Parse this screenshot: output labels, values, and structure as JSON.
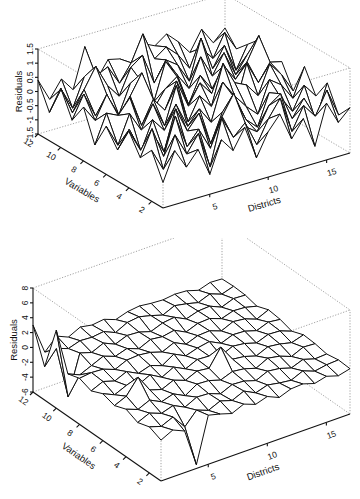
{
  "chart_data": [
    {
      "type": "surface",
      "title": "",
      "xlabel": "Districts",
      "ylabel": "Variables",
      "zlabel": "Residuals",
      "x_ticks": [
        5,
        10,
        15
      ],
      "y_ticks": [
        2,
        4,
        6,
        8,
        10,
        12
      ],
      "z_ticks": [
        -1.5,
        -1,
        -0.5,
        0,
        0.5,
        1,
        1.5
      ],
      "z_tick_labels": [
        "-1.5",
        "-1",
        "-0.5",
        "0",
        "0.5",
        "1",
        "1.5"
      ],
      "xlim": [
        1,
        17
      ],
      "ylim": [
        1,
        12
      ],
      "zlim": [
        -1.5,
        1.5
      ],
      "grid": "wireframe",
      "n_districts": 17,
      "n_variables": 12,
      "z": [
        [
          -0.6,
          0.4,
          -0.3,
          0.2,
          -0.8,
          0.3,
          -0.2,
          0.5,
          -0.7,
          0.1,
          0.6,
          -0.4,
          0.2,
          -0.9,
          0.5,
          -0.3,
          0.1
        ],
        [
          0.3,
          -0.5,
          0.6,
          -0.2,
          0.4,
          -0.9,
          0.7,
          -0.1,
          0.3,
          -0.6,
          0.2,
          0.8,
          -0.5,
          0.3,
          -0.2,
          0.6,
          -0.4
        ],
        [
          -0.2,
          0.7,
          -0.4,
          0.9,
          -0.3,
          0.2,
          -0.6,
          0.4,
          1.1,
          -0.2,
          -0.5,
          0.3,
          0.6,
          -0.4,
          0.2,
          -0.7,
          0.5
        ],
        [
          0.5,
          -0.3,
          0.2,
          -0.6,
          0.8,
          -0.1,
          0.4,
          -0.8,
          0.2,
          0.6,
          -0.3,
          -0.7,
          0.4,
          0.1,
          -0.5,
          0.3,
          -0.2
        ],
        [
          -0.4,
          0.2,
          -0.7,
          0.3,
          -0.2,
          0.6,
          -0.3,
          0.2,
          -0.4,
          0.9,
          0.3,
          -0.2,
          -0.6,
          0.5,
          0.2,
          -0.4,
          0.6
        ],
        [
          0.2,
          -0.6,
          0.4,
          -0.3,
          0.5,
          -0.4,
          0.9,
          -0.5,
          0.3,
          -0.2,
          1.2,
          0.4,
          0.2,
          -0.3,
          0.7,
          0.2,
          -0.5
        ],
        [
          -0.7,
          0.3,
          0.1,
          0.6,
          -0.5,
          0.3,
          -0.2,
          0.7,
          -0.3,
          0.4,
          -0.1,
          0.5,
          -0.8,
          0.6,
          -0.2,
          0.4,
          0.3
        ],
        [
          0.4,
          -0.2,
          0.6,
          -0.8,
          0.3,
          1.0,
          -0.4,
          0.2,
          0.5,
          -0.6,
          0.3,
          -0.3,
          0.4,
          -0.2,
          0.3,
          1.1,
          -0.3
        ],
        [
          -0.3,
          0.5,
          -0.4,
          0.2,
          -0.6,
          0.4,
          0.3,
          -0.5,
          0.8,
          0.2,
          -0.4,
          0.6,
          -0.2,
          0.5,
          -0.4,
          0.2,
          0.6
        ],
        [
          0.6,
          -0.4,
          0.3,
          1.0,
          0.2,
          -0.3,
          0.6,
          0.9,
          -0.2,
          0.5,
          0.2,
          -0.5,
          0.9,
          -0.3,
          0.4,
          -0.6,
          0.2
        ],
        [
          -0.5,
          0.2,
          -0.6,
          0.4,
          0.3,
          0.5,
          -0.2,
          0.4,
          1.3,
          0.3,
          0.6,
          0.2,
          -0.4,
          0.2,
          -0.3,
          0.5,
          -0.2
        ],
        [
          0.4,
          -0.4,
          0.2,
          -0.3,
          1.1,
          -0.2,
          0.4,
          0.3,
          -0.4,
          0.6,
          0.4,
          0.7,
          0.3,
          -0.2,
          0.5,
          -0.1,
          0.3
        ]
      ]
    },
    {
      "type": "surface",
      "title": "",
      "xlabel": "Districts",
      "ylabel": "Variables",
      "zlabel": "Residuals",
      "x_ticks": [
        5,
        10,
        15
      ],
      "y_ticks": [
        2,
        4,
        6,
        8,
        10,
        12
      ],
      "z_ticks": [
        -6,
        -4,
        -2,
        0,
        2,
        4,
        6,
        8
      ],
      "z_tick_labels": [
        "-6",
        "-4",
        "-2",
        "0",
        "2",
        "4",
        "6",
        "8"
      ],
      "xlim": [
        1,
        17
      ],
      "ylim": [
        1,
        12
      ],
      "zlim": [
        -6,
        8
      ],
      "grid": "wireframe",
      "n_districts": 17,
      "n_variables": 12,
      "z": [
        [
          -0.5,
          0.3,
          -0.4,
          -5.5,
          0.6,
          0.2,
          -0.3,
          0.4,
          -0.2,
          0.3,
          -0.4,
          0.2,
          0.3,
          -0.2,
          0.2,
          -0.3,
          0.1
        ],
        [
          0.2,
          -0.3,
          0.4,
          -1.5,
          0.2,
          -0.4,
          0.3,
          -0.2,
          0.5,
          -0.3,
          0.2,
          -0.1,
          -0.3,
          0.4,
          -0.2,
          0.1,
          0.2
        ],
        [
          -0.3,
          0.4,
          -0.2,
          0.3,
          -0.5,
          0.3,
          0.2,
          -0.4,
          0.3,
          0.2,
          -0.3,
          0.4,
          0.2,
          -0.3,
          0.3,
          -0.2,
          -0.1
        ],
        [
          0.4,
          -0.2,
          0.5,
          -0.3,
          0.2,
          -0.6,
          0.4,
          0.3,
          -0.2,
          0.4,
          0.2,
          -0.3,
          0.5,
          0.2,
          -0.4,
          0.3,
          0.2
        ],
        [
          -0.2,
          0.5,
          2.5,
          0.2,
          -0.3,
          0.4,
          -0.2,
          0.5,
          0.3,
          2.6,
          0.4,
          0.2,
          -0.3,
          0.4,
          0.2,
          -0.2,
          0.3
        ],
        [
          0.3,
          -0.4,
          0.3,
          -0.2,
          0.6,
          -0.3,
          0.5,
          -0.3,
          0.4,
          0.3,
          -0.2,
          0.5,
          0.3,
          -0.2,
          0.4,
          0.3,
          -0.3
        ],
        [
          -0.4,
          0.3,
          -0.2,
          0.5,
          -0.3,
          0.2,
          -0.4,
          0.6,
          -0.2,
          0.3,
          0.6,
          -0.2,
          0.4,
          0.3,
          -0.2,
          0.4,
          0.2
        ],
        [
          0.2,
          0.4,
          0.3,
          -0.3,
          0.4,
          0.5,
          0.3,
          -0.2,
          0.5,
          -0.3,
          0.3,
          0.4,
          -0.2,
          0.5,
          0.3,
          -0.3,
          0.4
        ],
        [
          -0.3,
          -1.0,
          -0.3,
          0.4,
          -0.2,
          0.3,
          -0.3,
          0.4,
          0.2,
          0.5,
          -0.3,
          0.3,
          0.4,
          -0.2,
          0.3,
          0.2,
          -0.2
        ],
        [
          4.5,
          -5.0,
          0.3,
          -0.2,
          0.5,
          -0.2,
          0.4,
          0.3,
          -0.2,
          0.4,
          0.6,
          -0.2,
          0.3,
          0.4,
          -0.3,
          0.3,
          0.2
        ],
        [
          -1.5,
          0.4,
          -0.2,
          0.3,
          0.2,
          0.4,
          -0.3,
          0.5,
          0.7,
          0.3,
          -0.2,
          0.5,
          0.2,
          -0.2,
          0.4,
          -0.2,
          0.3
        ],
        [
          3.0,
          -1.2,
          0.4,
          -0.3,
          0.5,
          0.2,
          0.4,
          -0.2,
          0.3,
          0.5,
          0.3,
          0.2,
          0.4,
          0.3,
          -0.2,
          0.3,
          0.2
        ]
      ]
    }
  ],
  "plots": {
    "top": {
      "zlabel": "Residuals",
      "ylabel": "Variables",
      "xlabel": "Districts",
      "z_tick_labels": [
        "-1.5",
        "-1",
        "-0.5",
        "0",
        "0.5",
        "1",
        "1.5"
      ],
      "y_tick_labels": [
        "2",
        "4",
        "6",
        "8",
        "10",
        "12"
      ],
      "x_tick_labels": [
        "5",
        "10",
        "15"
      ]
    },
    "bottom": {
      "zlabel": "Residuals",
      "ylabel": "Variables",
      "xlabel": "Districts",
      "z_tick_labels": [
        "-6",
        "-4",
        "-2",
        "0",
        "2",
        "4",
        "6",
        "8"
      ],
      "y_tick_labels": [
        "2",
        "4",
        "6",
        "8",
        "10",
        "12"
      ],
      "x_tick_labels": [
        "5",
        "10",
        "15"
      ]
    }
  },
  "colors": {
    "mesh_line": "#111111",
    "mesh_fill": "#ffffff",
    "box_dotted": "#8a8a8a",
    "axis": "#111111"
  }
}
